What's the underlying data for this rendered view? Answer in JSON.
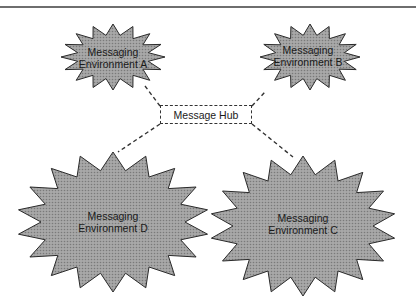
{
  "diagram": {
    "hub": {
      "label": "Message Hub"
    },
    "environments": [
      {
        "id": "A",
        "line1": "Messaging",
        "line2": "Environment A"
      },
      {
        "id": "B",
        "line1": "Messaging",
        "line2": "Environment B"
      },
      {
        "id": "C",
        "line1": "Messaging",
        "line2": "Environment C"
      },
      {
        "id": "D",
        "line1": "Messaging",
        "line2": "Environment D"
      }
    ],
    "connections": [
      {
        "from": "Message Hub",
        "to": "Messaging Environment A",
        "style": "dashed"
      },
      {
        "from": "Message Hub",
        "to": "Messaging Environment B",
        "style": "dashed"
      },
      {
        "from": "Message Hub",
        "to": "Messaging Environment C",
        "style": "dashed"
      },
      {
        "from": "Message Hub",
        "to": "Messaging Environment D",
        "style": "dashed"
      }
    ],
    "colors": {
      "burst_fill": "#9e9e9e",
      "burst_stroke": "#2a2a2a",
      "line": "#333333",
      "rule": "#6e6e6e"
    }
  }
}
